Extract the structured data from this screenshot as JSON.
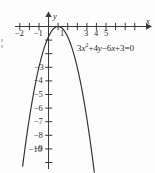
{
  "figure": {
    "equation_plain": "3x^2+4y-6x+3=0",
    "equation_parts": {
      "c3": "3",
      "x": "x",
      "exp2": "2",
      "plus4": "+4",
      "y": "y",
      "minus6": "−6",
      "x2": "x",
      "plus3_eq0": "+3=0"
    },
    "x_axis_name": "x",
    "y_axis_name": "y"
  },
  "chart_data": {
    "type": "line",
    "title": "",
    "subtitle": "",
    "xlabel": "x",
    "ylabel": "y",
    "equation": "3x²+4y−6x+3=0",
    "equation_solved": "y = −0.75(x−1)²",
    "curve_kind": "parabola",
    "opens": "downward",
    "vertex": [
      1,
      0
    ],
    "grid": false,
    "legend": null,
    "xlim": [
      -3,
      6.6
    ],
    "ylim": [
      -11.2,
      1.1
    ],
    "x_tick_values": [
      -2,
      -1,
      1,
      3,
      4,
      5
    ],
    "x_tick_labels": [
      "−2",
      "−1",
      "1",
      "3",
      "4",
      "5"
    ],
    "x_ticks_unlabeled": [
      -3,
      2,
      6
    ],
    "y_tick_values": [
      -3,
      -4,
      -5,
      -6,
      -7,
      -8,
      -9,
      -10
    ],
    "y_tick_labels": [
      "−3",
      "−4",
      "−5",
      "−6",
      "−7",
      "−8",
      "−9",
      "−10"
    ],
    "y_ticks_unlabeled": [
      -1,
      -2
    ],
    "series": [
      {
        "name": "3x²+4y−6x+3=0",
        "x": [
          -2.55,
          -2.3,
          -2.0,
          -1.7,
          -1.4,
          -1.1,
          -0.8,
          -0.5,
          -0.2,
          0.1,
          0.4,
          0.7,
          1.0,
          1.3,
          1.6,
          1.9,
          2.2,
          2.5,
          2.8,
          3.1,
          3.4,
          3.7,
          4.0,
          4.3,
          4.6
        ],
        "y": [
          -9.46,
          -8.17,
          -6.75,
          -5.47,
          -4.32,
          -3.31,
          -2.43,
          -1.69,
          -1.08,
          -0.61,
          -0.27,
          -0.07,
          0.0,
          -0.07,
          -0.27,
          -0.61,
          -1.08,
          -1.69,
          -2.43,
          -3.31,
          -4.32,
          -5.47,
          -6.75,
          -8.17,
          -9.72
        ]
      }
    ]
  }
}
